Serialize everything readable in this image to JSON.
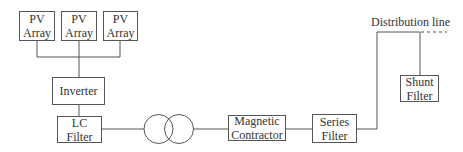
{
  "diagram": {
    "title": "",
    "blocks": {
      "pv1": {
        "label": "PV\nArray"
      },
      "pv2": {
        "label": "PV\nArray"
      },
      "pv3": {
        "label": "PV\nArray"
      },
      "inverter": {
        "label": "Inverter"
      },
      "lc_filter": {
        "label": "LC Filter"
      },
      "transformer": {
        "label": "",
        "icon": "transformer-symbol"
      },
      "magnetic_contractor": {
        "label": "Magnetic\nContractor"
      },
      "series_filter": {
        "label": "Series\nFilter"
      },
      "shunt_filter": {
        "label": "Shunt\nFilter"
      }
    },
    "distribution_line_label": "Distribution line",
    "connections": [
      [
        "pv1",
        "inverter"
      ],
      [
        "pv2",
        "inverter"
      ],
      [
        "pv3",
        "inverter"
      ],
      [
        "inverter",
        "lc_filter"
      ],
      [
        "lc_filter",
        "transformer"
      ],
      [
        "transformer",
        "magnetic_contractor"
      ],
      [
        "magnetic_contractor",
        "series_filter"
      ],
      [
        "series_filter",
        "distribution_line"
      ],
      [
        "distribution_line",
        "shunt_filter"
      ]
    ],
    "colors": {
      "line": "#555555",
      "text": "#333333",
      "background": "#ffffff"
    }
  }
}
